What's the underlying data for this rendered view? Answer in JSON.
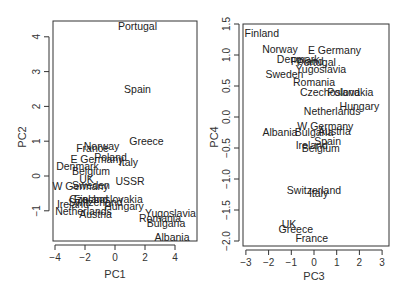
{
  "chart_data": [
    {
      "type": "scatter",
      "title": "",
      "xlabel": "PC1",
      "ylabel": "PC2",
      "xlim": [
        -4.2,
        5.4
      ],
      "ylim": [
        -1.9,
        4.5
      ],
      "xticks": [
        -4,
        -2,
        0,
        2,
        4
      ],
      "yticks": [
        -1,
        0,
        1,
        2,
        3,
        4
      ],
      "grid": false,
      "legend": null,
      "marker": "text-label",
      "points": [
        {
          "label": "Portugal",
          "x": 1.5,
          "y": 4.3
        },
        {
          "label": "Spain",
          "x": 1.5,
          "y": 2.5
        },
        {
          "label": "Greece",
          "x": 2.1,
          "y": 1.0
        },
        {
          "label": "Norway",
          "x": -0.9,
          "y": 0.85
        },
        {
          "label": "France",
          "x": -1.5,
          "y": 0.8
        },
        {
          "label": "Poland",
          "x": -0.3,
          "y": 0.55
        },
        {
          "label": "E Germany",
          "x": -1.2,
          "y": 0.5
        },
        {
          "label": "Italy",
          "x": 0.9,
          "y": 0.4
        },
        {
          "label": "Denmark",
          "x": -2.5,
          "y": 0.3
        },
        {
          "label": "Belgium",
          "x": -1.6,
          "y": 0.15
        },
        {
          "label": "UK",
          "x": -1.9,
          "y": -0.1
        },
        {
          "label": "USSR",
          "x": 1.0,
          "y": -0.15
        },
        {
          "label": "Sweden",
          "x": -1.6,
          "y": -0.25
        },
        {
          "label": "W Germany",
          "x": -2.3,
          "y": -0.3
        },
        {
          "label": "Finland",
          "x": -1.6,
          "y": -0.65
        },
        {
          "label": "Czechoslovakia",
          "x": -0.6,
          "y": -0.65
        },
        {
          "label": "Switzerland",
          "x": -1.3,
          "y": -0.75
        },
        {
          "label": "Ireland",
          "x": -2.8,
          "y": -0.8
        },
        {
          "label": "Hungary",
          "x": 0.6,
          "y": -0.85
        },
        {
          "label": "Netherlands",
          "x": -2.1,
          "y": -1.0
        },
        {
          "label": "Austria",
          "x": -1.3,
          "y": -1.1
        },
        {
          "label": "Yugoslavia",
          "x": 3.7,
          "y": -1.05
        },
        {
          "label": "Romania",
          "x": 3.0,
          "y": -1.2
        },
        {
          "label": "Bulgaria",
          "x": 3.4,
          "y": -1.35
        },
        {
          "label": "Albania",
          "x": 3.8,
          "y": -1.75
        }
      ]
    },
    {
      "type": "scatter",
      "title": "",
      "xlabel": "PC3",
      "ylabel": "PC4",
      "xlim": [
        -3.1,
        3.3
      ],
      "ylim": [
        -2.1,
        1.5
      ],
      "xticks": [
        -3,
        -2,
        -1,
        0,
        1,
        2,
        3
      ],
      "yticks": [
        -2.0,
        -1.5,
        -1.0,
        -0.5,
        0.0,
        0.5,
        1.0,
        1.5
      ],
      "grid": false,
      "legend": null,
      "marker": "text-label",
      "points": [
        {
          "label": "Finland",
          "x": -2.3,
          "y": 1.35
        },
        {
          "label": "Norway",
          "x": -1.5,
          "y": 1.1
        },
        {
          "label": "E Germany",
          "x": 0.9,
          "y": 1.08
        },
        {
          "label": "Denmark",
          "x": -0.7,
          "y": 0.93
        },
        {
          "label": "Poland",
          "x": -0.3,
          "y": 0.9
        },
        {
          "label": "Portugal",
          "x": 0.1,
          "y": 0.88
        },
        {
          "label": "Yugoslavia",
          "x": 0.3,
          "y": 0.78
        },
        {
          "label": "Sweden",
          "x": -1.3,
          "y": 0.7
        },
        {
          "label": "Romania",
          "x": 0.0,
          "y": 0.56
        },
        {
          "label": "Czechoslovakia",
          "x": 1.0,
          "y": 0.41
        },
        {
          "label": "Poland",
          "x": 1.3,
          "y": 0.41
        },
        {
          "label": "Hungary",
          "x": 2.0,
          "y": 0.18
        },
        {
          "label": "Netherlands",
          "x": 0.8,
          "y": 0.1
        },
        {
          "label": "W Germany",
          "x": 0.5,
          "y": -0.15
        },
        {
          "label": "Austria",
          "x": 0.9,
          "y": -0.22
        },
        {
          "label": "Albania",
          "x": -1.5,
          "y": -0.24
        },
        {
          "label": "Bulgaria",
          "x": 0.0,
          "y": -0.24
        },
        {
          "label": "Spain",
          "x": 0.6,
          "y": -0.38
        },
        {
          "label": "Ireland",
          "x": -0.1,
          "y": -0.45
        },
        {
          "label": "Belgium",
          "x": 0.3,
          "y": -0.5
        },
        {
          "label": "Switzerland",
          "x": 0.0,
          "y": -1.18
        },
        {
          "label": "Italy",
          "x": 0.2,
          "y": -1.22
        },
        {
          "label": "UK",
          "x": -1.1,
          "y": -1.73
        },
        {
          "label": "Greece",
          "x": -0.8,
          "y": -1.8
        },
        {
          "label": "France",
          "x": -0.1,
          "y": -1.95
        }
      ]
    }
  ]
}
